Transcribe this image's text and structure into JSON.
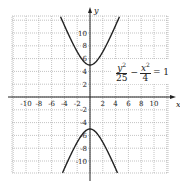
{
  "chart_data": {
    "type": "line",
    "title": "",
    "xlabel": "x",
    "ylabel": "y",
    "xlim": [
      -12,
      12
    ],
    "ylim": [
      -12.5,
      12.5
    ],
    "grid": true,
    "x_ticks": [
      -10,
      -8,
      -6,
      -4,
      -2,
      2,
      4,
      6,
      8,
      10
    ],
    "y_ticks": [
      10,
      8,
      6,
      4,
      2,
      -2,
      -4,
      -6,
      -8,
      -10
    ],
    "x_tick_labels": [
      "-10",
      "-8",
      "-6",
      "-4",
      "-2",
      "2",
      "4",
      "6",
      "8",
      "10"
    ],
    "y_tick_labels": [
      "10",
      "8",
      "6",
      "4",
      "2",
      "-2",
      "-4",
      "-6",
      "-8",
      "-10"
    ],
    "equation": {
      "y_num": "y",
      "y_exp": "2",
      "y_den": "25",
      "minus": "−",
      "x_num": "x",
      "x_exp": "2",
      "x_den": "4",
      "rhs": "= 1"
    },
    "series": [
      {
        "name": "upper branch",
        "formula": "y = 5*sqrt(1 + x^2/4)",
        "vertex": [
          0,
          5
        ]
      },
      {
        "name": "lower branch",
        "formula": "y = -5*sqrt(1 + x^2/4)",
        "vertex": [
          0,
          -5
        ]
      }
    ],
    "color": "#222222"
  }
}
